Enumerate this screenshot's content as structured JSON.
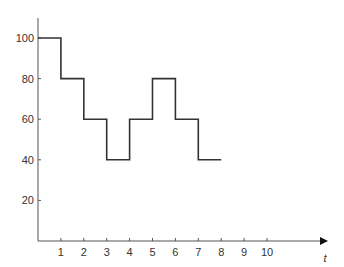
{
  "chart_data": {
    "type": "line",
    "subtype": "step",
    "title": "",
    "xlabel": "t",
    "ylabel": "",
    "x_ticks": [
      1,
      2,
      3,
      4,
      5,
      6,
      7,
      8,
      9,
      10
    ],
    "y_ticks": [
      20,
      40,
      60,
      80,
      100
    ],
    "xlim": [
      0,
      12.6
    ],
    "ylim": [
      0,
      110
    ],
    "grid": false,
    "legend": null,
    "series": [
      {
        "name": "step",
        "steps": [
          {
            "x_start": 0,
            "x_end": 1,
            "y": 100
          },
          {
            "x_start": 1,
            "x_end": 2,
            "y": 80
          },
          {
            "x_start": 2,
            "x_end": 3,
            "y": 60
          },
          {
            "x_start": 3,
            "x_end": 4,
            "y": 40
          },
          {
            "x_start": 4,
            "x_end": 5,
            "y": 60
          },
          {
            "x_start": 5,
            "x_end": 6,
            "y": 80
          },
          {
            "x_start": 6,
            "x_end": 7,
            "y": 60
          },
          {
            "x_start": 7,
            "x_end": 8,
            "y": 40
          }
        ]
      }
    ],
    "colors": {
      "line": "#333333",
      "axis": "#555555",
      "text": "#333333"
    }
  }
}
